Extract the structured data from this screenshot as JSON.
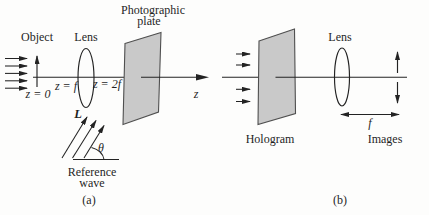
{
  "colors": {
    "background": "#fdfdfc",
    "line": "#232323",
    "text": "#1f1f1f",
    "plate_fill": "#c9c9c9",
    "plate_stroke": "#4f4f4f",
    "lens_fill": "#d2d2d2",
    "lens_stroke": "#3a3a3a",
    "arrow_fill": "#232323"
  },
  "panel_a": {
    "caption": "(a)",
    "object_label": "Object",
    "lens_label": "Lens",
    "plate_label_line1": "Photographic",
    "plate_label_line2": "plate",
    "z_origin": "z = 0",
    "z_focal": "z = f",
    "z_double_focal": "z = 2f",
    "axis_label": "z",
    "lens_symbol": "L",
    "angle_symbol": "θ",
    "reference_label_line1": "Reference",
    "reference_label_line2": "wave"
  },
  "panel_b": {
    "caption": "(b)",
    "lens_label": "Lens",
    "hologram_label": "Hologram",
    "images_label": "Images",
    "focal_label": "f"
  }
}
